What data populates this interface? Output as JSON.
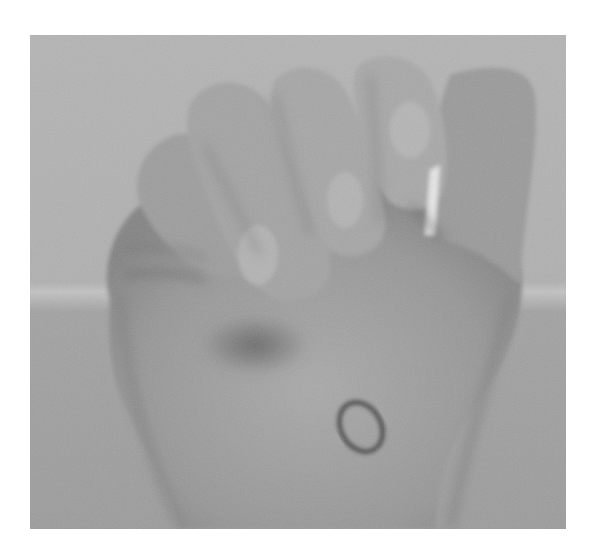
{
  "image": {
    "subject": "Hand in a closed fist with an oval mark drawn on the wrist",
    "style": "grayscale photograph",
    "colors": {
      "page_background": "#ffffff",
      "background_upper": "#b3b3b3",
      "background_lower": "#9e9e9e",
      "skin_light": "#a6a6a6",
      "skin_mid": "#8f8f8f",
      "skin_shadow": "#6a6a6a",
      "mark_outline": "#3a3a3a"
    },
    "annotations": [
      {
        "type": "oval-mark",
        "location": "wrist, center-right",
        "label": ""
      }
    ]
  }
}
